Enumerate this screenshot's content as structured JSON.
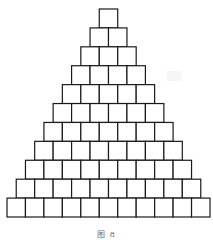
{
  "figure": {
    "type": "square-block-pyramid",
    "rows": [
      1,
      2,
      3,
      4,
      5,
      6,
      7,
      8,
      9,
      10,
      11
    ],
    "total_squares": 66,
    "stroke_color": "#1a1a1a",
    "fill_color": "#ffffff"
  },
  "caption": {
    "text": "图 8"
  }
}
